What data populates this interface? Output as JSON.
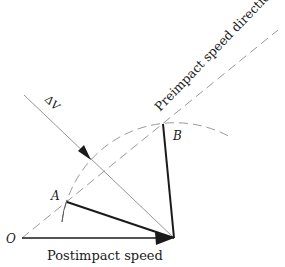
{
  "diagram": {
    "labels": {
      "origin": "O",
      "point_a": "A",
      "point_b": "B",
      "delta_v": "ΔV",
      "preimpact": "Preimpact speed direction",
      "postimpact": "Postimpact speed"
    },
    "colors": {
      "ink": "#1a1a1a",
      "thin_line": "#8a8a8a",
      "dashed": "#9a9a9a",
      "background": "#ffffff"
    }
  }
}
